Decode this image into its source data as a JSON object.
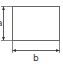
{
  "diagram": {
    "type": "rectangle-dimensions",
    "shape": "rectangle",
    "labels": {
      "height": "a",
      "width": "b"
    },
    "colors": {
      "stroke": "#555555",
      "text": "#333333",
      "background": "#ffffff"
    }
  }
}
